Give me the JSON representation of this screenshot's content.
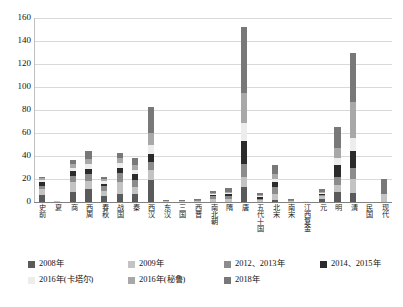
{
  "chart_data": {
    "type": "bar",
    "stacked": true,
    "title": "",
    "subtitle": "",
    "xlabel": "",
    "ylabel": "",
    "ylim": [
      0,
      160
    ],
    "ytick_step": 20,
    "yticks": [
      "0",
      "20",
      "40",
      "60",
      "80",
      "100",
      "120",
      "140",
      "160"
    ],
    "grid": true,
    "legend_position": "bottom",
    "categories": [
      "史前",
      "夏",
      "商",
      "西周",
      "春秋",
      "战国",
      "秦",
      "西汉",
      "东汉",
      "三国",
      "西晋",
      "南北朝",
      "隋",
      "唐",
      "五代十国",
      "北宋",
      "南宋",
      "江西复金",
      "元",
      "明",
      "清",
      "民国",
      "现代"
    ],
    "series": [
      {
        "name": "2008年",
        "color": "#5a5a5a",
        "values": [
          6,
          0,
          9,
          11,
          5,
          7,
          7,
          19,
          0,
          0,
          0,
          0,
          0,
          13,
          0,
          2,
          0,
          0,
          3,
          9,
          8,
          0,
          0
        ]
      },
      {
        "name": "2009年",
        "color": "#c3c3c3",
        "values": [
          5,
          1,
          8,
          7,
          5,
          10,
          6,
          9,
          1,
          1,
          1,
          3,
          3,
          9,
          2,
          5,
          1,
          0,
          2,
          6,
          12,
          0,
          7
        ]
      },
      {
        "name": "2012、2013年",
        "color": "#8c8c8c",
        "values": [
          3,
          0,
          6,
          6,
          4,
          8,
          6,
          7,
          0,
          0,
          1,
          2,
          2,
          11,
          1,
          6,
          1,
          0,
          1,
          7,
          10,
          0,
          0
        ]
      },
      {
        "name": "2014、2015年",
        "color": "#2b2b2b",
        "values": [
          3,
          0,
          4,
          5,
          2,
          5,
          5,
          7,
          0,
          0,
          0,
          1,
          2,
          20,
          1,
          4,
          0,
          0,
          1,
          10,
          14,
          0,
          0
        ]
      },
      {
        "name": "2016年(卡塔尔)",
        "color": "#ededed",
        "values": [
          2,
          0,
          3,
          4,
          2,
          4,
          4,
          8,
          0,
          0,
          0,
          1,
          1,
          16,
          1,
          3,
          0,
          1,
          1,
          6,
          12,
          0,
          0
        ]
      },
      {
        "name": "2016年(秘鲁)",
        "color": "#a8a8a8",
        "values": [
          2,
          0,
          3,
          4,
          2,
          4,
          4,
          10,
          0,
          0,
          0,
          1,
          1,
          26,
          1,
          4,
          0,
          0,
          1,
          9,
          31,
          0,
          0
        ]
      },
      {
        "name": "2018年",
        "color": "#787878",
        "values": [
          1,
          0,
          4,
          7,
          2,
          5,
          6,
          23,
          1,
          1,
          1,
          2,
          3,
          57,
          2,
          8,
          1,
          0,
          2,
          18,
          43,
          0,
          13
        ]
      }
    ],
    "totals": [
      22,
      1,
      37,
      44,
      22,
      43,
      38,
      83,
      2,
      2,
      3,
      10,
      12,
      152,
      8,
      32,
      3,
      1,
      11,
      65,
      130,
      0,
      20
    ]
  },
  "legend": {
    "items": [
      {
        "label": "2008年",
        "color": "#5a5a5a"
      },
      {
        "label": "2009年",
        "color": "#c3c3c3"
      },
      {
        "label": "2012、2013年",
        "color": "#8c8c8c"
      },
      {
        "label": "2014、2015年",
        "color": "#2b2b2b"
      },
      {
        "label": "2016年(卡塔尔)",
        "color": "#ededed"
      },
      {
        "label": "2016年(秘鲁)",
        "color": "#a8a8a8"
      },
      {
        "label": "2018年",
        "color": "#787878"
      }
    ]
  },
  "style": {
    "grid_color": "#d9d9d9",
    "axis_color": "#808080",
    "background": "#ffffff",
    "text_color": "#111111"
  }
}
